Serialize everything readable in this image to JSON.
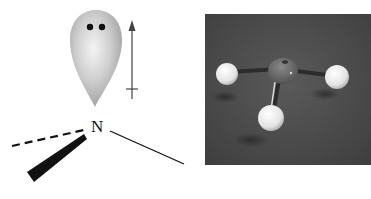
{
  "diagram": {
    "atom_label": "N",
    "lone_pair": {
      "electrons": 2,
      "lobe_color": "#b8b8b8"
    },
    "dipole_arrow": {
      "direction": "up"
    },
    "bonds": [
      {
        "type": "dashed",
        "meaning": "behind-plane"
      },
      {
        "type": "wedge",
        "meaning": "toward-viewer"
      },
      {
        "type": "solid",
        "meaning": "in-plane"
      }
    ]
  },
  "photo": {
    "subject": "ball-and-stick molecular model",
    "central_atom_color": "#6e6e6e",
    "outer_atom_color": "#e8e8e8",
    "background_color": "#4a4a4a"
  }
}
